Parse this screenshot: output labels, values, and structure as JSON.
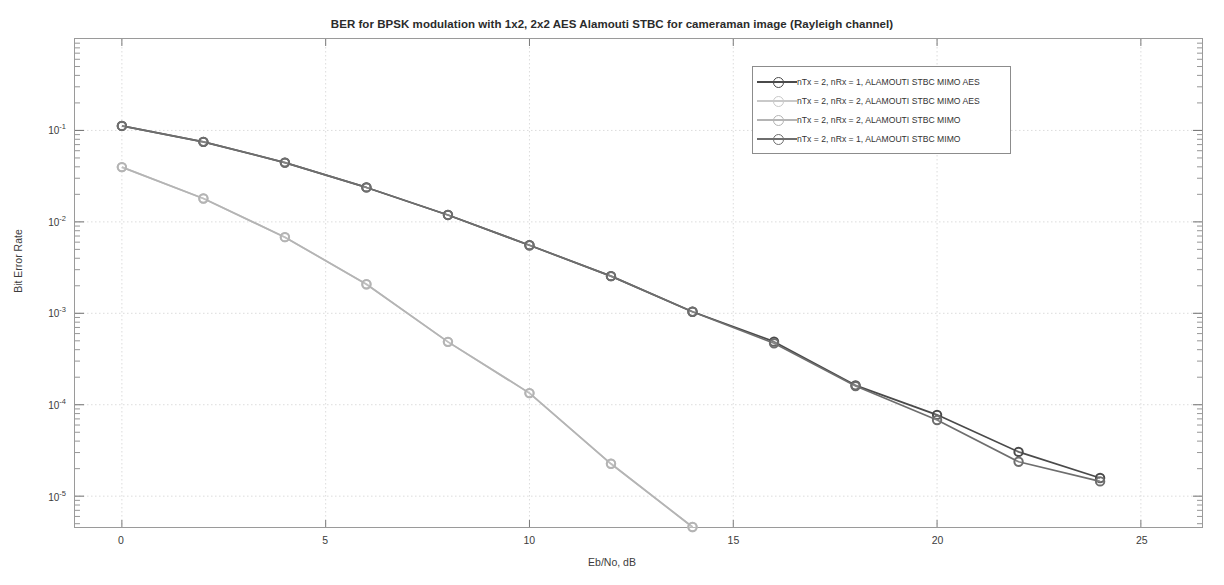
{
  "figure": {
    "title": "BER for BPSK modulation with 1x2, 2x2 AES Alamouti STBC for cameraman image (Rayleigh channel)",
    "background": "#ffffff"
  },
  "axes": {
    "xlabel": "Eb/No, dB",
    "ylabel": "Bit Error Rate",
    "x_ticks": [
      "0",
      "5",
      "10",
      "15",
      "20",
      "25"
    ],
    "y_ticks": [
      "10-1",
      "10-2",
      "10-3",
      "10-4",
      "10-5"
    ],
    "y_tick_bases": [
      "10",
      "10",
      "10",
      "10",
      "10"
    ],
    "y_tick_exponents": [
      "-1",
      "-2",
      "-3",
      "-4",
      "-5"
    ],
    "grid": "on",
    "box": "on"
  },
  "legend": {
    "position": "north-east-inside",
    "border_color": "#8c8c8c",
    "entries": [
      {
        "label": "nTx = 2, nRx = 1, ALAMOUTI STBC MIMO AES",
        "color": "#4a4a4a",
        "marker": "circle"
      },
      {
        "label": "nTx = 2, nRx = 2, ALAMOUTI STBC MIMO AES",
        "color": "#c9c9c9",
        "marker": "circle"
      },
      {
        "label": "nTx = 2, nRx = 2, ALAMOUTI STBC MIMO",
        "color": "#b4b4b4",
        "marker": "circle"
      },
      {
        "label": "nTx = 2, nRx = 1, ALAMOUTI STBC MIMO",
        "color": "#6e6e6e",
        "marker": "circle"
      }
    ]
  },
  "chart_data": {
    "type": "line",
    "title": "BER for BPSK modulation with 1x2, 2x2 AES Alamouti STBC for cameraman image (Rayleigh channel)",
    "xlabel": "Eb/No, dB",
    "ylabel": "Bit Error Rate",
    "yscale": "log",
    "xlim": [
      -1.15,
      26.5
    ],
    "ylim": [
      4.6e-06,
      1.0
    ],
    "x": [
      0,
      2,
      4,
      6,
      8,
      10,
      12,
      14,
      16,
      18,
      20,
      22,
      24
    ],
    "series": [
      {
        "name": "nTx = 2, nRx = 1, ALAMOUTI STBC MIMO AES",
        "color": "#4a4a4a",
        "marker": "circle",
        "values": [
          0.112,
          0.075,
          0.0445,
          0.0238,
          0.0119,
          0.00555,
          0.00255,
          0.00104,
          0.00049,
          0.000163,
          7.75e-05,
          3.05e-05,
          1.58e-05
        ]
      },
      {
        "name": "nTx = 2, nRx = 2, ALAMOUTI STBC MIMO AES",
        "color": "#c9c9c9",
        "marker": "circle",
        "values": [
          0.0397,
          0.018,
          0.0068,
          0.00208,
          0.000487,
          0.000134,
          2.26e-05,
          4.6e-06,
          null,
          null,
          null,
          null,
          null
        ]
      },
      {
        "name": "nTx = 2, nRx = 2, ALAMOUTI STBC MIMO",
        "color": "#b4b4b4",
        "marker": "circle",
        "values": [
          0.0397,
          0.018,
          0.0068,
          0.00208,
          0.000487,
          0.000134,
          2.26e-05,
          4.6e-06,
          null,
          null,
          null,
          null,
          null
        ]
      },
      {
        "name": "nTx = 2, nRx = 1, ALAMOUTI STBC MIMO",
        "color": "#6e6e6e",
        "marker": "circle",
        "values": [
          0.112,
          0.075,
          0.0445,
          0.0238,
          0.0119,
          0.00555,
          0.00255,
          0.00104,
          0.00047,
          0.00016,
          6.8e-05,
          2.38e-05,
          1.45e-05
        ]
      }
    ]
  }
}
